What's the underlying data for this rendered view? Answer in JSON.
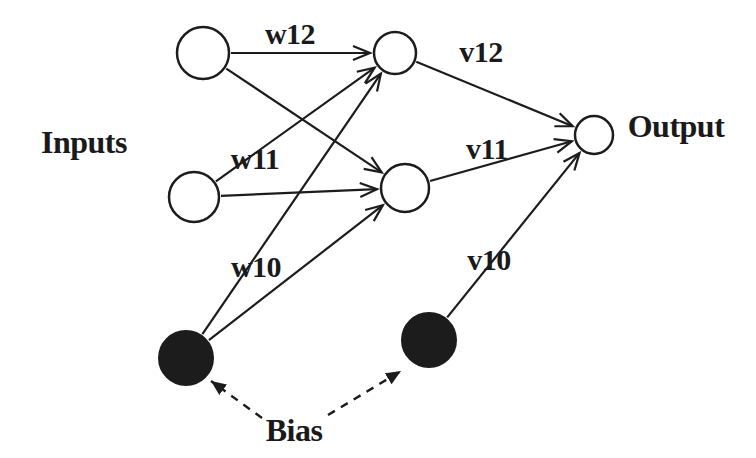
{
  "colors": {
    "background": "#ffffff",
    "stroke": "#1c1c1c",
    "open_node_fill": "#ffffff",
    "bias_node_fill": "#1c1c1c"
  },
  "diagram": {
    "nodes": [
      {
        "id": "input-node-1",
        "kind": "input",
        "x": 203,
        "y": 53,
        "r": 26,
        "type": "open"
      },
      {
        "id": "input-node-2",
        "kind": "input",
        "x": 194,
        "y": 197,
        "r": 25,
        "type": "open"
      },
      {
        "id": "hidden-node-1",
        "kind": "hidden",
        "x": 395,
        "y": 53,
        "r": 21,
        "type": "open"
      },
      {
        "id": "hidden-node-2",
        "kind": "hidden",
        "x": 405,
        "y": 188,
        "r": 24,
        "type": "open"
      },
      {
        "id": "output-node",
        "kind": "output",
        "x": 594,
        "y": 135,
        "r": 19,
        "type": "open"
      },
      {
        "id": "bias-node-1",
        "kind": "bias",
        "x": 186,
        "y": 358,
        "r": 27,
        "type": "filled"
      },
      {
        "id": "bias-node-2",
        "kind": "bias",
        "x": 429,
        "y": 340,
        "r": 27,
        "type": "filled"
      }
    ],
    "edges": [
      {
        "id": "edge-input1-hidden1",
        "from": "input-node-1",
        "to": "hidden-node-1",
        "style": "solid"
      },
      {
        "id": "edge-input1-hidden2",
        "from": "input-node-1",
        "to": "hidden-node-2",
        "style": "solid"
      },
      {
        "id": "edge-input2-hidden1",
        "from": "input-node-2",
        "to": "hidden-node-1",
        "style": "solid"
      },
      {
        "id": "edge-input2-hidden2",
        "from": "input-node-2",
        "to": "hidden-node-2",
        "style": "solid"
      },
      {
        "id": "edge-bias1-hidden1",
        "from": "bias-node-1",
        "to": "hidden-node-1",
        "style": "solid"
      },
      {
        "id": "edge-bias1-hidden2",
        "from": "bias-node-1",
        "to": "hidden-node-2",
        "style": "solid"
      },
      {
        "id": "edge-hidden1-output",
        "from": "hidden-node-1",
        "to": "output-node",
        "style": "solid"
      },
      {
        "id": "edge-hidden2-output",
        "from": "hidden-node-2",
        "to": "output-node",
        "style": "solid"
      },
      {
        "id": "edge-bias2-output",
        "from": "bias-node-2",
        "to": "output-node",
        "style": "solid"
      },
      {
        "id": "bias-callout-left",
        "from": {
          "x": 262,
          "y": 418
        },
        "to": {
          "x": 211,
          "y": 381
        },
        "style": "dashed"
      },
      {
        "id": "bias-callout-right",
        "from": {
          "x": 328,
          "y": 415
        },
        "to": {
          "x": 401,
          "y": 371
        },
        "style": "dashed"
      }
    ],
    "labels": [
      {
        "id": "inputs-label",
        "text": "Inputs",
        "x": 84,
        "y": 142,
        "kind": "main"
      },
      {
        "id": "output-label",
        "text": "Output",
        "x": 676,
        "y": 126,
        "kind": "main"
      },
      {
        "id": "bias-label",
        "text": "Bias",
        "x": 294,
        "y": 430,
        "kind": "main"
      },
      {
        "id": "weight-w12",
        "text": "w12",
        "x": 290,
        "y": 33,
        "kind": "weight"
      },
      {
        "id": "weight-w11",
        "text": "w11",
        "x": 255,
        "y": 158,
        "kind": "weight"
      },
      {
        "id": "weight-w10",
        "text": "w10",
        "x": 256,
        "y": 266,
        "kind": "weight"
      },
      {
        "id": "weight-v12",
        "text": "v12",
        "x": 481,
        "y": 51,
        "kind": "weight"
      },
      {
        "id": "weight-v11",
        "text": "v11",
        "x": 487,
        "y": 148,
        "kind": "weight"
      },
      {
        "id": "weight-v10",
        "text": "v10",
        "x": 489,
        "y": 259,
        "kind": "weight"
      }
    ]
  }
}
